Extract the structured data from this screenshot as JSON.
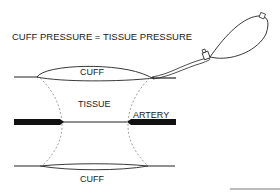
{
  "diagram": {
    "title": "CUFF PRESSURE = TISSUE PRESSURE",
    "labels": {
      "top_cuff": "CUFF",
      "tissue": "TISSUE",
      "artery": "ARTERY",
      "bottom_cuff": "CUFF"
    },
    "components": [
      "inflation-bulb",
      "valve",
      "tubing",
      "top-cuff",
      "bottom-cuff",
      "artery",
      "tissue-boundary"
    ],
    "colors": {
      "line": "#222222",
      "dashed": "#888888",
      "artery": "#111111",
      "background": "#ffffff"
    }
  }
}
